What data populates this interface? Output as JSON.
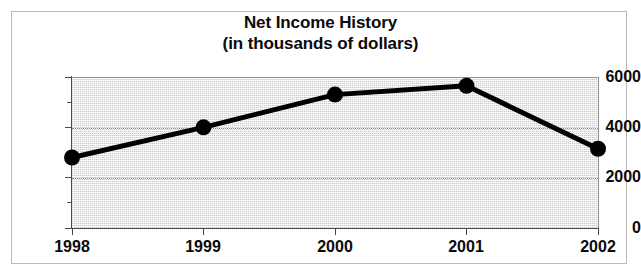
{
  "chart_data": {
    "type": "line",
    "title": "Net Income History",
    "subtitle": "(in thousands of dollars)",
    "title_lines": [
      "Net Income History",
      "(in thousands of dollars)"
    ],
    "xlabel": "",
    "ylabel": "",
    "categories": [
      "1998",
      "1999",
      "2000",
      "2001",
      "2002"
    ],
    "x": [
      1998,
      1999,
      2000,
      2001,
      2002
    ],
    "values": [
      2800,
      4000,
      5300,
      5650,
      3150
    ],
    "series": [
      {
        "name": "Net Income",
        "values": [
          2800,
          4000,
          5300,
          5650,
          3150
        ]
      }
    ],
    "ylim": [
      0,
      6000
    ],
    "ytick_labels": [
      "0",
      "2000",
      "4000",
      "6000"
    ],
    "yticks": [
      0,
      2000,
      4000,
      6000
    ],
    "y_minor_ticks": [
      1000,
      3000,
      5000
    ],
    "xtick_labels": [
      "1998",
      "1999",
      "2000",
      "2001",
      "2002"
    ],
    "grid": true,
    "grid_axis": "y",
    "legend": false,
    "legend_position": "none",
    "marker": "filled-circle",
    "line_color": "#000000",
    "marker_color": "#000000",
    "plot_background": "#ececec",
    "frame_color": "#b9b9b9",
    "text_color": "#0a0a0a"
  }
}
